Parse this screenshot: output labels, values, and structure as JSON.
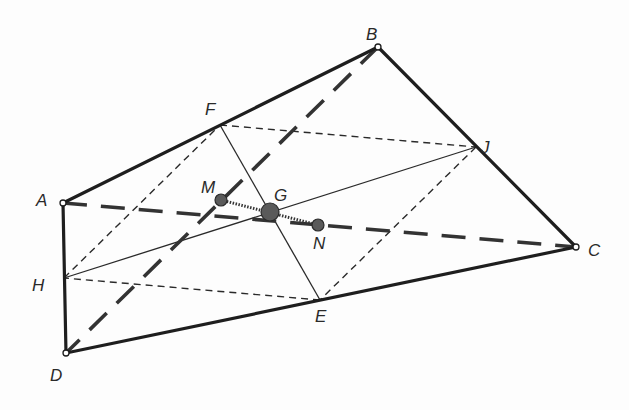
{
  "diagram": {
    "type": "geometry",
    "colors": {
      "stroke": "#1e1e1e",
      "point_fill": "#5a5a5a",
      "background": "#fdfdfd"
    },
    "points": [
      {
        "id": "A",
        "label": "A",
        "x": 63,
        "y": 203,
        "kind": "vertex"
      },
      {
        "id": "B",
        "label": "B",
        "x": 378,
        "y": 47,
        "kind": "vertex"
      },
      {
        "id": "C",
        "label": "C",
        "x": 576,
        "y": 247,
        "kind": "vertex"
      },
      {
        "id": "D",
        "label": "D",
        "x": 66,
        "y": 353,
        "kind": "vertex"
      },
      {
        "id": "F",
        "label": "F",
        "x": 220,
        "y": 125,
        "kind": "midpoint"
      },
      {
        "id": "J",
        "label": "J",
        "x": 476,
        "y": 147,
        "kind": "midpoint"
      },
      {
        "id": "E",
        "label": "E",
        "x": 320,
        "y": 300,
        "kind": "midpoint"
      },
      {
        "id": "H",
        "label": "H",
        "x": 64,
        "y": 278,
        "kind": "midpoint"
      },
      {
        "id": "M",
        "label": "M",
        "x": 221,
        "y": 200,
        "kind": "midpoint-diagonal"
      },
      {
        "id": "G",
        "label": "G",
        "x": 270,
        "y": 212,
        "kind": "centroid"
      },
      {
        "id": "N",
        "label": "N",
        "x": 318,
        "y": 225,
        "kind": "midpoint-diagonal"
      }
    ],
    "labels": {
      "A": "A",
      "B": "B",
      "C": "C",
      "D": "D",
      "E": "E",
      "F": "F",
      "G": "G",
      "H": "H",
      "J": "J",
      "M": "M",
      "N": "N"
    },
    "segments": [
      {
        "from": "A",
        "to": "B",
        "style": "thick"
      },
      {
        "from": "B",
        "to": "C",
        "style": "thick"
      },
      {
        "from": "C",
        "to": "D",
        "style": "thick"
      },
      {
        "from": "D",
        "to": "A",
        "style": "thick"
      },
      {
        "from": "A",
        "to": "C",
        "style": "long-dash"
      },
      {
        "from": "B",
        "to": "D",
        "style": "long-dash"
      },
      {
        "from": "F",
        "to": "J",
        "style": "short-dash"
      },
      {
        "from": "J",
        "to": "E",
        "style": "short-dash"
      },
      {
        "from": "E",
        "to": "H",
        "style": "short-dash"
      },
      {
        "from": "H",
        "to": "F",
        "style": "short-dash"
      },
      {
        "from": "F",
        "to": "E",
        "style": "thin"
      },
      {
        "from": "H",
        "to": "J",
        "style": "thin"
      },
      {
        "from": "M",
        "to": "N",
        "style": "dotted"
      }
    ]
  }
}
